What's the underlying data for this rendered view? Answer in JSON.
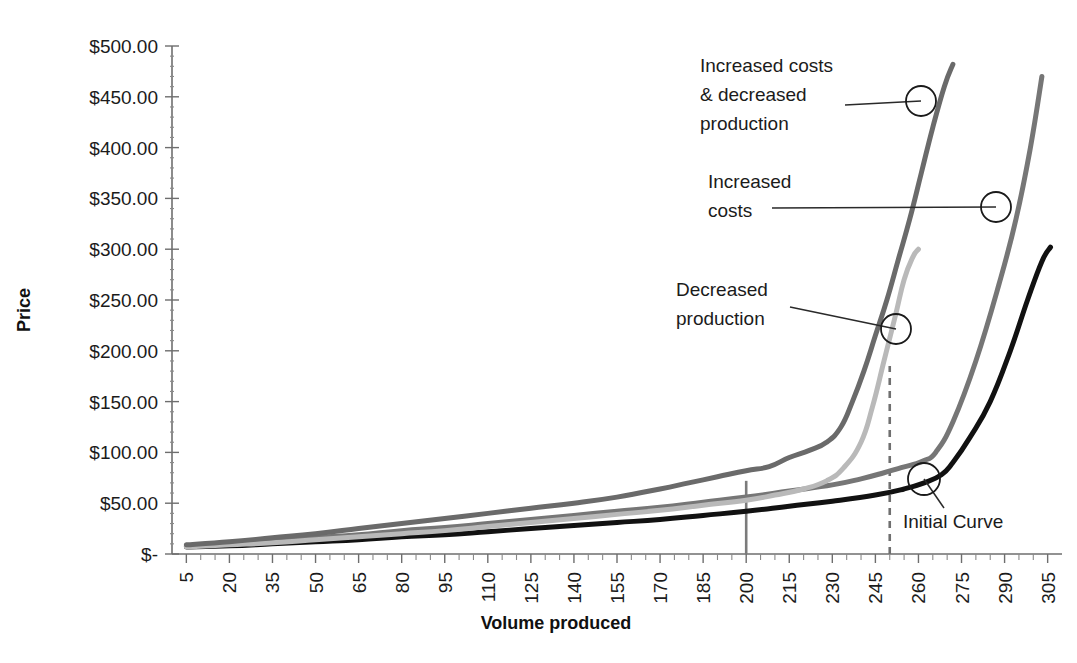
{
  "chart_data": {
    "type": "line",
    "title": "",
    "xlabel": "Volume produced",
    "ylabel": "Price",
    "xlim": [
      0,
      310
    ],
    "ylim": [
      0,
      500
    ],
    "grid": false,
    "legend_position": "none",
    "y_tick_labels": [
      "$500.00",
      "$450.00",
      "$400.00",
      "$350.00",
      "$300.00",
      "$250.00",
      "$200.00",
      "$150.00",
      "$100.00",
      "$50.00",
      "$-"
    ],
    "y_tick_values": [
      500,
      450,
      400,
      350,
      300,
      250,
      200,
      150,
      100,
      50,
      0
    ],
    "x_tick_labels": [
      "5",
      "20",
      "35",
      "50",
      "65",
      "80",
      "95",
      "110",
      "125",
      "140",
      "155",
      "170",
      "185",
      "200",
      "215",
      "230",
      "245",
      "260",
      "275",
      "290",
      "305"
    ],
    "x_tick_values": [
      5,
      20,
      35,
      50,
      65,
      80,
      95,
      110,
      125,
      140,
      155,
      170,
      185,
      200,
      215,
      230,
      245,
      260,
      275,
      290,
      305
    ],
    "series": [
      {
        "name": "Initial Curve",
        "color": "#111111",
        "width": 5.0,
        "dash": "none",
        "x": [
          5,
          20,
          35,
          50,
          65,
          80,
          95,
          110,
          125,
          140,
          155,
          170,
          185,
          200,
          215,
          230,
          245,
          255,
          262,
          268,
          272,
          278,
          285,
          292,
          298,
          303,
          306
        ],
        "y": [
          7,
          8,
          10,
          12,
          14,
          17,
          19,
          22,
          25,
          28,
          31,
          34,
          38,
          42,
          47,
          52,
          58,
          64,
          70,
          78,
          90,
          115,
          150,
          200,
          250,
          288,
          302
        ]
      },
      {
        "name": "Increased costs",
        "color": "#767676",
        "width": 5.0,
        "dash": "none",
        "x": [
          5,
          20,
          35,
          50,
          65,
          80,
          95,
          110,
          125,
          140,
          155,
          170,
          185,
          200,
          215,
          230,
          240,
          248,
          254,
          258,
          262,
          266,
          272,
          280,
          288,
          294,
          299,
          303
        ],
        "y": [
          8,
          10,
          13,
          16,
          19,
          23,
          26,
          30,
          34,
          38,
          42,
          46,
          51,
          56,
          62,
          68,
          74,
          80,
          85,
          88,
          92,
          100,
          130,
          190,
          265,
          330,
          400,
          470
        ]
      },
      {
        "name": "Decreased production",
        "color": "#b9b9b9",
        "width": 5.0,
        "dash": "none",
        "x": [
          5,
          20,
          35,
          50,
          65,
          80,
          95,
          110,
          125,
          140,
          155,
          170,
          185,
          200,
          210,
          220,
          228,
          234,
          240,
          244,
          248,
          252,
          255,
          258,
          260
        ],
        "y": [
          7,
          9,
          11,
          14,
          17,
          20,
          23,
          27,
          31,
          35,
          39,
          43,
          48,
          53,
          58,
          64,
          72,
          85,
          110,
          145,
          190,
          235,
          270,
          292,
          300
        ]
      },
      {
        "name": "Increased costs & decreased production",
        "color": "#6a6a6a",
        "width": 5.0,
        "dash": "none",
        "x": [
          5,
          20,
          35,
          50,
          65,
          80,
          95,
          110,
          125,
          140,
          155,
          170,
          180,
          190,
          200,
          208,
          215,
          222,
          228,
          233,
          237,
          241,
          245,
          249,
          253,
          257,
          261,
          265,
          269,
          272
        ],
        "y": [
          9,
          12,
          16,
          20,
          25,
          30,
          35,
          40,
          45,
          50,
          56,
          64,
          70,
          76,
          82,
          86,
          95,
          102,
          110,
          125,
          150,
          180,
          215,
          250,
          290,
          330,
          375,
          420,
          460,
          482
        ]
      }
    ],
    "reference_lines": [
      {
        "name": "capacity-line-solid",
        "orientation": "vertical",
        "x": 200,
        "y_from": 0,
        "y_to": 72,
        "style": "solid",
        "color": "#7b7b7b"
      },
      {
        "name": "capacity-line-dashed",
        "orientation": "vertical",
        "x": 250,
        "y_from": 0,
        "y_to": 185,
        "style": "dashed",
        "color": "#6f6f6f"
      }
    ],
    "annotations": [
      {
        "name": "increased-costs-decreased-production",
        "lines": [
          "Increased costs",
          "& decreased",
          "production"
        ],
        "text_x": 700,
        "text_y": 72,
        "leader_from_x": 845,
        "leader_from_y": 105,
        "marker_x": 921,
        "marker_y": 101,
        "marker_r": 15
      },
      {
        "name": "increased-costs",
        "lines": [
          "Increased",
          "costs"
        ],
        "text_x": 708,
        "text_y": 188,
        "leader_from_x": 772,
        "leader_from_y": 208,
        "marker_x": 996,
        "marker_y": 207,
        "marker_r": 15
      },
      {
        "name": "decreased-production",
        "lines": [
          "Decreased",
          "production"
        ],
        "text_x": 676,
        "text_y": 296,
        "leader_from_x": 790,
        "leader_from_y": 307,
        "marker_x": 896,
        "marker_y": 329,
        "marker_r": 15
      },
      {
        "name": "initial-curve",
        "lines": [
          "Initial Curve"
        ],
        "text_x": 903,
        "text_y": 528,
        "leader_from_x": 944,
        "leader_from_y": 508,
        "marker_x": 924,
        "marker_y": 479,
        "marker_r": 16
      }
    ]
  },
  "layout": {
    "plot_left": 172,
    "plot_right": 1062,
    "plot_top": 46,
    "plot_bottom": 554
  }
}
